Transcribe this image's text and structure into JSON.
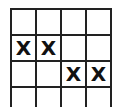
{
  "grid": {
    "rows": 4,
    "cols": 4,
    "cells": [
      [
        "",
        "",
        "",
        ""
      ],
      [
        "X",
        "X",
        "",
        ""
      ],
      [
        "",
        "",
        "X",
        "X"
      ],
      [
        "",
        "",
        "",
        ""
      ]
    ]
  }
}
